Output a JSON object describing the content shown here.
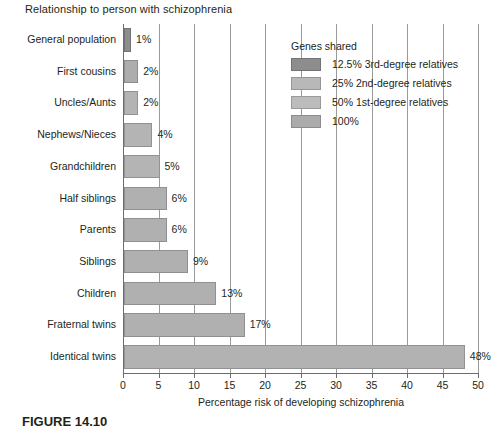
{
  "figure": {
    "caption": "FIGURE 14.10"
  },
  "chart_data": {
    "type": "bar",
    "orientation": "horizontal",
    "title": "Relationship to person with schizophrenia",
    "xlabel": "Percentage risk of developing schizophrenia",
    "ylabel": "",
    "xlim": [
      0,
      50
    ],
    "xticks": [
      "0",
      "5",
      "10",
      "15",
      "20",
      "25",
      "30",
      "35",
      "40",
      "45",
      "50"
    ],
    "grid": "vertical",
    "categories": [
      "General population",
      "First cousins",
      "Uncles/Aunts",
      "Nephews/Nieces",
      "Grandchildren",
      "Half siblings",
      "Parents",
      "Siblings",
      "Children",
      "Fraternal twins",
      "Identical twins"
    ],
    "values": [
      1,
      2,
      2,
      4,
      5,
      6,
      6,
      9,
      13,
      17,
      48
    ],
    "value_labels": [
      "1%",
      "2%",
      "2%",
      "4%",
      "5%",
      "6%",
      "6%",
      "9%",
      "13%",
      "17%",
      "48%"
    ],
    "bar_groups": [
      "12.5% 3rd-degree relatives",
      "25% 2nd-degree relatives",
      "25% 2nd-degree relatives",
      "25% 2nd-degree relatives",
      "25% 2nd-degree relatives",
      "50% 1st-degree relatives",
      "50% 1st-degree relatives",
      "50% 1st-degree relatives",
      "50% 1st-degree relatives",
      "50% 1st-degree relatives",
      "100%"
    ],
    "bar_colors": [
      "#8d8d8d",
      "#adadad",
      "#b4b4b4",
      "#b4b4b4",
      "#b4b4b4",
      "#b0b0b0",
      "#b0b0b0",
      "#b0b0b0",
      "#b0b0b0",
      "#b0b0b0",
      "#b2b2b2"
    ],
    "legend": {
      "position": "upper-right",
      "title": "Genes shared",
      "entries": [
        {
          "label": "12.5% 3rd-degree relatives",
          "color": "#8d8d8d"
        },
        {
          "label": "25% 2nd-degree relatives",
          "color": "#b8b8b8"
        },
        {
          "label": "50% 1st-degree relatives",
          "color": "#bcbcbc"
        },
        {
          "label": "100%",
          "color": "#ababab"
        }
      ]
    }
  }
}
